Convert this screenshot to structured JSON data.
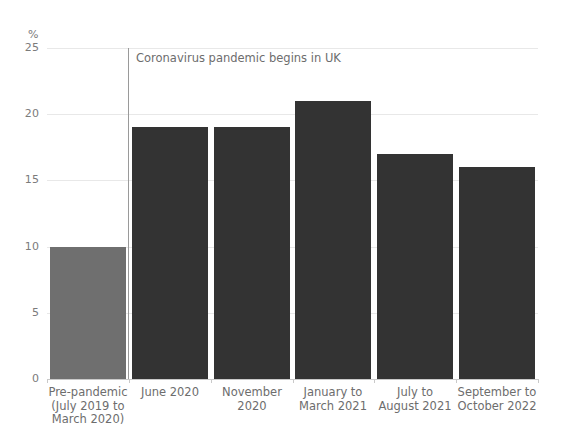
{
  "chart_data": {
    "type": "bar",
    "title": "",
    "xlabel": "",
    "ylabel": "%",
    "ylim": [
      0,
      25
    ],
    "grid": true,
    "legend": "none",
    "yticks": [
      "0",
      "5",
      "10",
      "15",
      "20",
      "25"
    ],
    "categories": [
      "Pre-pandemic\n(July 2019 to\nMarch 2020)",
      "June 2020",
      "November 2020",
      "January to\nMarch 2021",
      "July to\nAugust 2021",
      "September to\nOctober 2022"
    ],
    "category_lines": [
      [
        "Pre-pandemic",
        "(July 2019 to",
        "March 2020)"
      ],
      [
        "June 2020"
      ],
      [
        "November 2020"
      ],
      [
        "January to",
        "March 2021"
      ],
      [
        "July to",
        "August 2021"
      ],
      [
        "September to",
        "October 2022"
      ]
    ],
    "values": [
      10,
      19,
      19,
      21,
      17,
      16
    ],
    "bar_colors": [
      "#6f6f6f",
      "#333333",
      "#333333",
      "#333333",
      "#333333",
      "#333333"
    ],
    "annotations": [
      {
        "name": "pandemic-start",
        "text": "Coronavirus pandemic begins in UK",
        "type": "vertical-line",
        "between_categories": [
          0,
          1
        ]
      }
    ]
  },
  "axis": {
    "unit_label": "%"
  },
  "colors": {
    "background": "#ffffff",
    "gridline": "#e8e8e8",
    "axis_text": "#7b7b7b",
    "label_text": "#6d6d6d",
    "bar_highlight": "#6f6f6f",
    "bar_primary": "#333333",
    "annotation_line": "#9a9a9a"
  }
}
